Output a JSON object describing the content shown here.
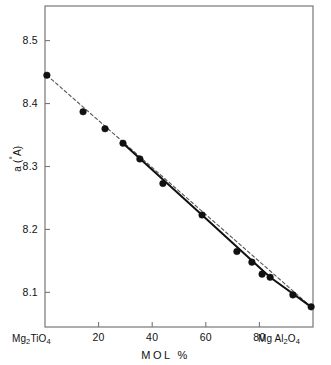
{
  "chart_data": {
    "type": "scatter",
    "title": "",
    "xlabel": "MOL  %",
    "ylabel": "a (Å)",
    "xlim": [
      0,
      100
    ],
    "ylim": [
      8.045,
      8.555
    ],
    "grid": false,
    "legend": "none",
    "x_ticks": [
      20,
      40,
      60,
      80
    ],
    "x_tick_labels": [
      "20",
      "40",
      "60",
      "80"
    ],
    "y_ticks": [
      8.1,
      8.2,
      8.3,
      8.4,
      8.5
    ],
    "y_tick_labels": [
      "8.1",
      "8.2",
      "8.3",
      "8.4",
      "8.5"
    ],
    "x_end_labels": {
      "left": "Mg2TiO4",
      "right": "MgAl2O4"
    },
    "points": [
      {
        "x": 0.7,
        "y": 8.445
      },
      {
        "x": 14.2,
        "y": 8.387
      },
      {
        "x": 22.4,
        "y": 8.36
      },
      {
        "x": 29.1,
        "y": 8.337
      },
      {
        "x": 35.4,
        "y": 8.312
      },
      {
        "x": 44.0,
        "y": 8.273
      },
      {
        "x": 58.6,
        "y": 8.223
      },
      {
        "x": 71.6,
        "y": 8.165
      },
      {
        "x": 77.2,
        "y": 8.148
      },
      {
        "x": 81.0,
        "y": 8.129
      },
      {
        "x": 84.0,
        "y": 8.124
      },
      {
        "x": 92.5,
        "y": 8.096
      },
      {
        "x": 99.3,
        "y": 8.077
      }
    ],
    "series": [
      {
        "name": "vegard-dashed-line",
        "style": "dashed",
        "x": [
          0.7,
          99.3
        ],
        "values": [
          8.445,
          8.077
        ]
      },
      {
        "name": "measured-solid-line",
        "style": "solid",
        "x": [
          29.1,
          58.6,
          84.0,
          99.3
        ],
        "values": [
          8.337,
          8.223,
          8.124,
          8.077
        ]
      }
    ],
    "colors": {
      "marker": "#111111",
      "solid_line": "#111111",
      "dashed_line": "#555555",
      "axis": "#777777",
      "background": "#ffffff"
    }
  }
}
